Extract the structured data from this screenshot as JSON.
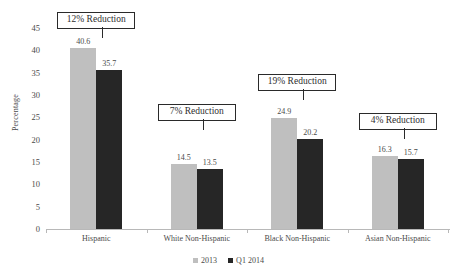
{
  "chart_data": {
    "type": "bar",
    "title": "",
    "xlabel": "",
    "ylabel": "Percentage",
    "ylim": [
      0,
      45
    ],
    "ytick_step": 5,
    "yticks": [
      "0",
      "5",
      "10",
      "15",
      "20",
      "25",
      "30",
      "35",
      "40",
      "45"
    ],
    "grid": false,
    "legend_position": "bottom-center",
    "categories": [
      "Hispanic",
      "White Non-Hispanic",
      "Black Non-Hispanic",
      "Asian Non-Hispanic"
    ],
    "series": [
      {
        "name": "2013",
        "color": "#bfbfbf",
        "values": [
          40.6,
          14.5,
          24.9,
          16.3
        ]
      },
      {
        "name": "Q1 2014",
        "color": "#262626",
        "values": [
          35.7,
          13.5,
          20.2,
          15.7
        ]
      }
    ],
    "value_labels": [
      [
        "40.6",
        "35.7"
      ],
      [
        "14.5",
        "13.5"
      ],
      [
        "24.9",
        "20.2"
      ],
      [
        "16.3",
        "15.7"
      ]
    ],
    "annotations": [
      {
        "text": "12% Reduction",
        "category": "Hispanic"
      },
      {
        "text": "7% Reduction",
        "category": "White Non-Hispanic"
      },
      {
        "text": "19% Reduction",
        "category": "Black Non-Hispanic"
      },
      {
        "text": "4% Reduction",
        "category": "Asian Non-Hispanic"
      }
    ]
  },
  "axis": {
    "y_title": "Percentage"
  },
  "legend": {
    "items": [
      {
        "label": "2013",
        "color": "#bfbfbf"
      },
      {
        "label": "Q1 2014",
        "color": "#262626"
      }
    ]
  }
}
